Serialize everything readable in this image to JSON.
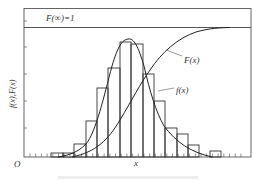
{
  "chart_data": {
    "type": "bar",
    "title": "",
    "xlabel": "x",
    "ylabel": "f(x),F(x)",
    "origin_label": "O",
    "grid": false,
    "annotations": [
      {
        "text": "F(∞)=1",
        "role": "asymptote-label"
      },
      {
        "text": "F(x)",
        "role": "cdf-curve-label"
      },
      {
        "text": "f(x)",
        "role": "pdf-curve-label"
      }
    ],
    "ylim": [
      0,
      1
    ],
    "series": [
      {
        "name": "histogram",
        "type": "bar",
        "bins": [
          {
            "x0": 51,
            "x1": 63,
            "top": 153
          },
          {
            "x0": 63,
            "x1": 74,
            "top": 153
          },
          {
            "x0": 74,
            "x1": 86,
            "top": 144
          },
          {
            "x0": 86,
            "x1": 97,
            "top": 121
          },
          {
            "x0": 97,
            "x1": 108,
            "top": 88
          },
          {
            "x0": 108,
            "x1": 120,
            "top": 68
          },
          {
            "x0": 120,
            "x1": 131,
            "top": 42
          },
          {
            "x0": 131,
            "x1": 143,
            "top": 44
          },
          {
            "x0": 143,
            "x1": 154,
            "top": 74
          },
          {
            "x0": 154,
            "x1": 165,
            "top": 101
          },
          {
            "x0": 165,
            "x1": 177,
            "top": 128
          },
          {
            "x0": 177,
            "x1": 188,
            "top": 134
          },
          {
            "x0": 188,
            "x1": 199,
            "top": 145
          },
          {
            "x0": 210,
            "x1": 221,
            "top": 151
          }
        ],
        "relative_heights": [
          0.03,
          0.03,
          0.09,
          0.25,
          0.48,
          0.62,
          0.8,
          0.79,
          0.58,
          0.39,
          0.2,
          0.16,
          0.08,
          0.04
        ]
      },
      {
        "name": "f(x)",
        "type": "line",
        "description": "probability density curve, bell-shaped with peak near the 7th bin"
      },
      {
        "name": "F(x)",
        "type": "line",
        "description": "cumulative distribution curve rising from 0 to asymptote F(∞)=1"
      }
    ]
  },
  "figure": {
    "asymptote_label": "F(∞)=1",
    "cdf_label": "F(x)",
    "pdf_label": "f(x)",
    "y_axis_label": "f(x),F(x)",
    "x_axis_label": "x",
    "origin_label": "O",
    "caption": ""
  }
}
